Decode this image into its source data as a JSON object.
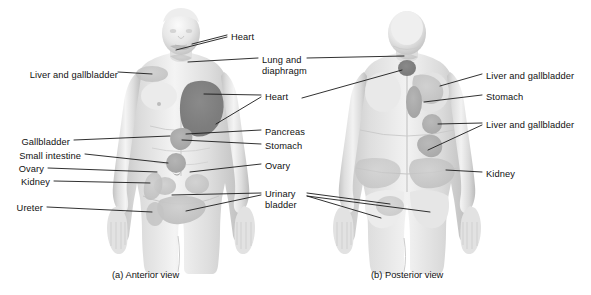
{
  "figure": {
    "width": 591,
    "height": 295,
    "background_color": "#ffffff",
    "text_color": "#111111",
    "leader_line_color": "#1a1a1a",
    "body_fill_color": "#d9d9d9",
    "body_shadow_color": "#b4b4b4",
    "body_highlight_color": "#f2f2f2",
    "pain_region_light_color": "#bdbdbd",
    "pain_region_mid_color": "#a8a8a8",
    "pain_region_dark_color": "#7d7d7d"
  },
  "panels": [
    {
      "id": "anterior",
      "caption": "(a) Anterior view",
      "caption_x": 112,
      "caption_y": 276
    },
    {
      "id": "posterior",
      "caption": "(b) Posterior view",
      "caption_x": 371,
      "caption_y": 276
    }
  ],
  "labels": {
    "anterior_left": [
      {
        "text": "Liver and gallbladder",
        "x": 11,
        "y": 75,
        "leader": "from-right"
      },
      {
        "text": "Gallbladder",
        "x": 11,
        "y": 143,
        "leader": "from-right"
      },
      {
        "text": "Small intestine",
        "x": 11,
        "y": 157,
        "leader": "from-right"
      },
      {
        "text": "Ovary",
        "x": 11,
        "y": 171,
        "leader": "from-right"
      },
      {
        "text": "Kidney",
        "x": 11,
        "y": 184,
        "leader": "from-right"
      },
      {
        "text": "Ureter",
        "x": 11,
        "y": 210,
        "leader": "from-right"
      }
    ],
    "anterior_right": [
      {
        "text": "Heart",
        "x": 231,
        "y": 38,
        "leader": "from-left"
      },
      {
        "text": "Lung and",
        "x": 262,
        "y": 61,
        "leader": "from-left"
      },
      {
        "text": "diaphragm",
        "x": 262,
        "y": 72,
        "leader": "none"
      },
      {
        "text": "Heart",
        "x": 265,
        "y": 98,
        "leader": "from-left"
      },
      {
        "text": "Pancreas",
        "x": 265,
        "y": 133,
        "leader": "from-left"
      },
      {
        "text": "Stomach",
        "x": 265,
        "y": 147,
        "leader": "from-left"
      },
      {
        "text": "Ovary",
        "x": 265,
        "y": 167,
        "leader": "from-left"
      },
      {
        "text": "Urinary",
        "x": 265,
        "y": 195,
        "leader": "from-left"
      },
      {
        "text": "bladder",
        "x": 265,
        "y": 206,
        "leader": "none"
      }
    ],
    "posterior_right": [
      {
        "text": "Liver and gallbladder",
        "x": 486,
        "y": 77,
        "leader": "from-left"
      },
      {
        "text": "Stomach",
        "x": 486,
        "y": 98,
        "leader": "from-left"
      },
      {
        "text": "Liver and gallbladder",
        "x": 486,
        "y": 126,
        "leader": "from-left"
      },
      {
        "text": "Kidney",
        "x": 486,
        "y": 175,
        "leader": "from-left"
      }
    ]
  },
  "organ_terms": [
    "Heart",
    "Lung and diaphragm",
    "Liver and gallbladder",
    "Gallbladder",
    "Stomach",
    "Pancreas",
    "Small intestine",
    "Ovary",
    "Kidney",
    "Ureter",
    "Urinary bladder"
  ]
}
